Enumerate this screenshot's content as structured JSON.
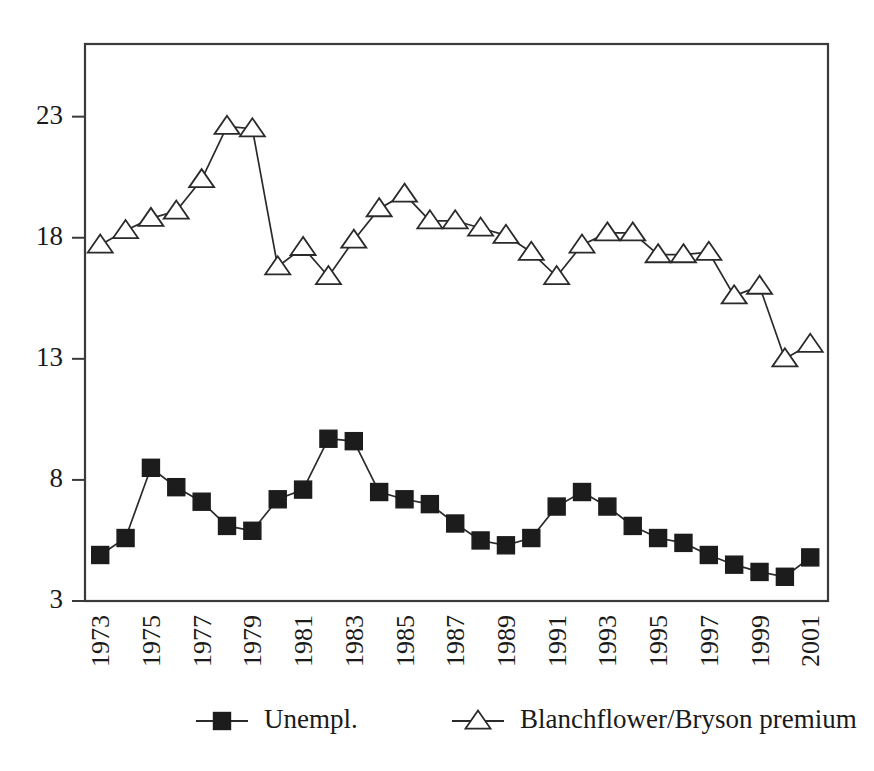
{
  "chart_data": {
    "type": "line",
    "title": "",
    "subtitle": "",
    "xlabel": "",
    "ylabel": "",
    "x": [
      1973,
      1974,
      1975,
      1976,
      1977,
      1978,
      1979,
      1980,
      1981,
      1982,
      1983,
      1984,
      1985,
      1986,
      1987,
      1988,
      1989,
      1990,
      1991,
      1992,
      1993,
      1994,
      1995,
      1996,
      1997,
      1998,
      1999,
      2000,
      2001
    ],
    "xtick_labels": [
      "1973",
      "1975",
      "1977",
      "1979",
      "1981",
      "1983",
      "1985",
      "1987",
      "1989",
      "1991",
      "1993",
      "1995",
      "1997",
      "1999",
      "2001"
    ],
    "xtick_values": [
      1973,
      1975,
      1977,
      1979,
      1981,
      1983,
      1985,
      1987,
      1989,
      1991,
      1993,
      1995,
      1997,
      1999,
      2001
    ],
    "ytick_labels": [
      "3",
      "8",
      "13",
      "18",
      "23"
    ],
    "ytick_values": [
      3,
      8,
      13,
      18,
      23
    ],
    "ylim": [
      3,
      26
    ],
    "xlim": [
      1972.4,
      2001.7
    ],
    "grid": false,
    "legend_position": "bottom",
    "series": [
      {
        "name": "Unempl.",
        "marker": "filled-square",
        "values": [
          4.9,
          5.6,
          8.5,
          7.7,
          7.1,
          6.1,
          5.9,
          7.2,
          7.6,
          9.7,
          9.6,
          7.5,
          7.2,
          7.0,
          6.2,
          5.5,
          5.3,
          5.6,
          6.9,
          7.5,
          6.9,
          6.1,
          5.6,
          5.4,
          4.9,
          4.5,
          4.2,
          4.0,
          4.8
        ]
      },
      {
        "name": "Blanchflower/Bryson premium",
        "marker": "open-triangle",
        "values": [
          17.7,
          18.3,
          18.8,
          19.1,
          20.4,
          22.6,
          22.5,
          16.8,
          17.6,
          16.4,
          17.9,
          19.2,
          19.8,
          18.7,
          18.7,
          18.4,
          18.1,
          17.4,
          16.4,
          17.7,
          18.2,
          18.2,
          17.3,
          17.3,
          17.4,
          15.6,
          16.0,
          13.0,
          13.6
        ]
      }
    ],
    "legend": [
      {
        "label": "Unempl.",
        "marker": "filled-square"
      },
      {
        "label": "Blanchflower/Bryson premium",
        "marker": "open-triangle"
      }
    ],
    "colors": {
      "axis": "#3a3a3a",
      "line": "#2a2a2a",
      "square_marker_fill": "#1c1c1c",
      "triangle_marker_fill": "#ffffff",
      "background": "#ffffff",
      "text": "#1a1a1a"
    }
  }
}
